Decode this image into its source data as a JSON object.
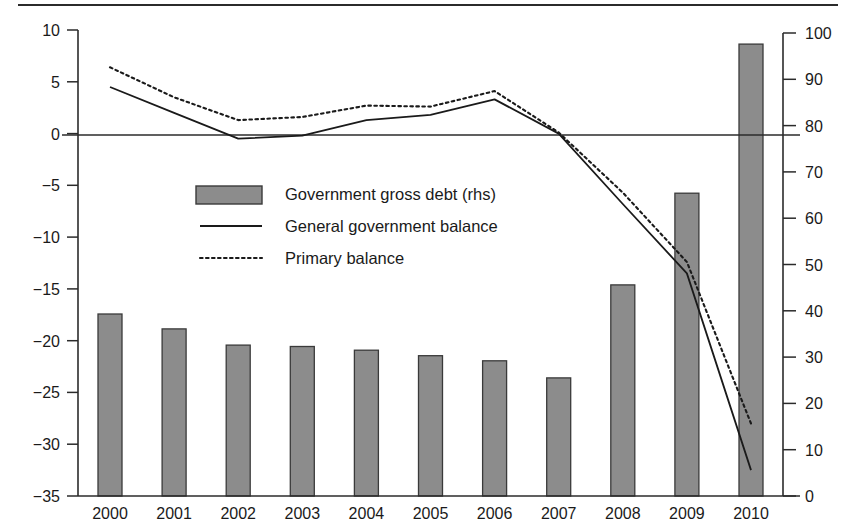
{
  "chart_data": {
    "type": "bar",
    "title": "",
    "subtitle": "",
    "xlabel": "",
    "ylabel": "",
    "y2label": "",
    "grid": false,
    "legend_position": "center-left-inside",
    "categories": [
      "2000",
      "2001",
      "2002",
      "2003",
      "2004",
      "2005",
      "2006",
      "2007",
      "2008",
      "2009",
      "2010"
    ],
    "left_axis": {
      "ticks": [
        "10",
        "5",
        "0",
        "-5",
        "-10",
        "-15",
        "-20",
        "-25",
        "-30",
        "-35"
      ],
      "tick_values": [
        10,
        5,
        0,
        -5,
        -10,
        -15,
        -20,
        -25,
        -30,
        -35
      ],
      "ylim": [
        -35,
        10
      ]
    },
    "right_axis": {
      "ticks": [
        "100",
        "90",
        "80",
        "70",
        "60",
        "50",
        "40",
        "30",
        "20",
        "10",
        "0"
      ],
      "tick_values": [
        100,
        90,
        80,
        70,
        60,
        50,
        40,
        30,
        20,
        10,
        0
      ],
      "ylim": [
        0,
        100
      ]
    },
    "zero_line_value": 0,
    "series": [
      {
        "name": "Government gross debt (rhs)",
        "kind": "bar",
        "axis": "right",
        "color": "#8c8c8c",
        "edge_color": "#3a3a3a",
        "values": [
          39.3,
          36.1,
          32.6,
          32.3,
          31.5,
          30.3,
          29.2,
          25.5,
          45.6,
          65.4,
          97.6
        ]
      },
      {
        "name": "General government balance",
        "kind": "line",
        "style": "solid",
        "axis": "left",
        "color": "#1a1a1a",
        "values": [
          4.5,
          2.0,
          -0.5,
          -0.2,
          1.3,
          1.8,
          3.3,
          0.0,
          -6.8,
          -13.5,
          -32.5
        ]
      },
      {
        "name": "Primary balance",
        "kind": "line",
        "style": "dotted",
        "axis": "left",
        "color": "#1a1a1a",
        "values": [
          6.4,
          3.5,
          1.3,
          1.6,
          2.7,
          2.6,
          4.1,
          0.1,
          -5.7,
          -12.4,
          -28.0
        ]
      }
    ]
  },
  "legend": {
    "items": [
      {
        "label": "Government gross debt (rhs)",
        "marker": "swatch"
      },
      {
        "label": "General government balance",
        "marker": "solid-line"
      },
      {
        "label": "Primary balance",
        "marker": "dotted-line"
      }
    ]
  },
  "colors": {
    "bar_fill": "#8c8c8c",
    "bar_edge": "#3a3a3a",
    "line": "#1a1a1a",
    "axis": "#2b2b2b",
    "background": "#ffffff"
  }
}
